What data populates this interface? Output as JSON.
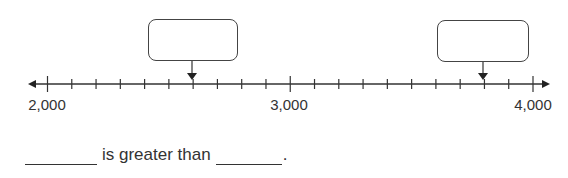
{
  "number_line": {
    "min": 2000,
    "max": 4000,
    "tick_interval": 100,
    "labeled_ticks": [
      {
        "value": 2000,
        "label": "2,000"
      },
      {
        "value": 3000,
        "label": "3,000"
      },
      {
        "value": 4000,
        "label": "4,000"
      }
    ],
    "arrows_both_ends": true
  },
  "answer_boxes": [
    {
      "points_to_value": 2600,
      "value": ""
    },
    {
      "points_to_value": 3800,
      "value": ""
    }
  ],
  "sentence": {
    "blank_1": "",
    "middle_text": "is greater than",
    "blank_2": "",
    "end": "."
  }
}
